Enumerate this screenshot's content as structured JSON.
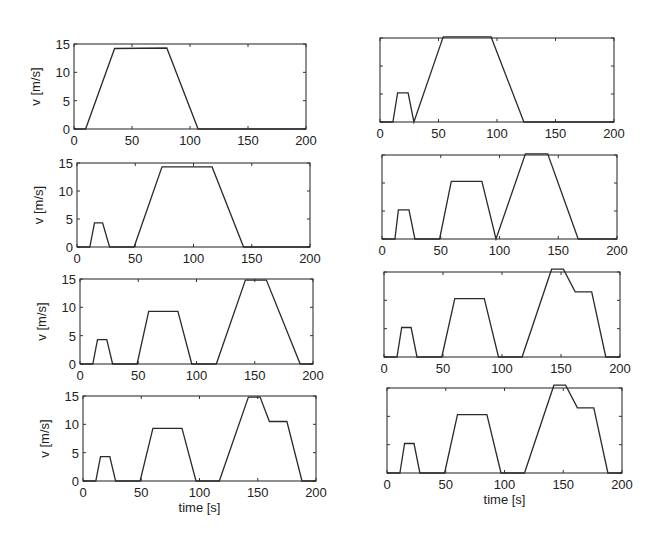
{
  "chart_data": [
    {
      "type": "line",
      "panel": "row1-left",
      "title": "",
      "xlabel": "",
      "ylabel": "v [m/s]",
      "xlim": [
        0,
        200
      ],
      "ylim": [
        0,
        15
      ],
      "xticks": [
        0,
        50,
        100,
        150,
        200
      ],
      "yticks": [
        0,
        5,
        10,
        15
      ],
      "show_xticklabels": true,
      "show_yticklabels": true,
      "x": [
        0,
        10,
        35,
        80,
        107,
        200
      ],
      "y": [
        0,
        0,
        14.2,
        14.3,
        0,
        0
      ],
      "box": {
        "left": 74,
        "right": 306,
        "top": 44,
        "bottom": 129
      }
    },
    {
      "type": "line",
      "panel": "row1-right",
      "title": "",
      "xlabel": "",
      "ylabel": "",
      "xlim": [
        0,
        200
      ],
      "ylim": [
        0,
        15
      ],
      "xticks": [
        0,
        50,
        100,
        150,
        200
      ],
      "yticks": [
        0,
        5,
        10,
        15
      ],
      "show_xticklabels": true,
      "show_yticklabels": false,
      "x": [
        0,
        11,
        15,
        24,
        29,
        54,
        95,
        123,
        200
      ],
      "y": [
        0,
        0,
        5.2,
        5.2,
        0,
        15.2,
        15.2,
        0,
        0
      ],
      "box": {
        "left": 380,
        "right": 614,
        "top": 38,
        "bottom": 122
      }
    },
    {
      "type": "line",
      "panel": "row2-left",
      "title": "",
      "xlabel": "",
      "ylabel": "v [m/s]",
      "xlim": [
        0,
        200
      ],
      "ylim": [
        0,
        15
      ],
      "xticks": [
        0,
        50,
        100,
        150,
        200
      ],
      "yticks": [
        0,
        5,
        10,
        15
      ],
      "show_xticklabels": true,
      "show_yticklabels": true,
      "x": [
        0,
        11,
        15,
        22,
        28,
        49,
        73,
        116,
        143,
        200
      ],
      "y": [
        0,
        0,
        4.3,
        4.3,
        0,
        0,
        14.3,
        14.3,
        0,
        0
      ],
      "box": {
        "left": 77,
        "right": 310,
        "top": 163,
        "bottom": 247
      }
    },
    {
      "type": "line",
      "panel": "row2-right",
      "title": "",
      "xlabel": "",
      "ylabel": "",
      "xlim": [
        0,
        200
      ],
      "ylim": [
        0,
        15
      ],
      "xticks": [
        0,
        50,
        100,
        150,
        200
      ],
      "yticks": [
        0,
        5,
        10,
        15
      ],
      "show_xticklabels": true,
      "show_yticklabels": false,
      "x": [
        0,
        11,
        14,
        23,
        28,
        49,
        59,
        85,
        97,
        122,
        141,
        167,
        200
      ],
      "y": [
        0,
        0,
        5.2,
        5.2,
        0,
        0,
        10.3,
        10.3,
        0,
        15.2,
        15.2,
        0,
        0
      ],
      "box": {
        "left": 382,
        "right": 617,
        "top": 155,
        "bottom": 239
      }
    },
    {
      "type": "line",
      "panel": "row3-left",
      "title": "",
      "xlabel": "",
      "ylabel": "v [m/s]",
      "xlim": [
        0,
        200
      ],
      "ylim": [
        0,
        15
      ],
      "xticks": [
        0,
        50,
        100,
        150,
        200
      ],
      "yticks": [
        0,
        5,
        10,
        15
      ],
      "show_xticklabels": true,
      "show_yticklabels": true,
      "x": [
        0,
        11,
        15,
        23,
        28,
        49,
        59,
        84,
        96,
        117,
        142,
        160,
        189,
        200
      ],
      "y": [
        0,
        0,
        4.3,
        4.3,
        0,
        0,
        9.3,
        9.3,
        0,
        0,
        14.8,
        14.8,
        0,
        0
      ],
      "box": {
        "left": 80,
        "right": 313,
        "top": 279,
        "bottom": 364
      }
    },
    {
      "type": "line",
      "panel": "row3-right",
      "title": "",
      "xlabel": "",
      "ylabel": "",
      "xlim": [
        0,
        200
      ],
      "ylim": [
        0,
        15
      ],
      "xticks": [
        0,
        50,
        100,
        150,
        200
      ],
      "yticks": [
        0,
        5,
        10,
        15
      ],
      "show_xticklabels": true,
      "show_yticklabels": false,
      "x": [
        0,
        11,
        15,
        23,
        28,
        49,
        60,
        85,
        97,
        117,
        142,
        152,
        162,
        176,
        188,
        200
      ],
      "y": [
        0,
        0,
        5.2,
        5.2,
        0,
        0,
        10.3,
        10.3,
        0,
        0,
        15.5,
        15.5,
        11.5,
        11.5,
        0,
        0
      ],
      "box": {
        "left": 384,
        "right": 620,
        "top": 272,
        "bottom": 357
      }
    },
    {
      "type": "line",
      "panel": "row4-left",
      "title": "",
      "xlabel": "time [s]",
      "ylabel": "v [m/s]",
      "xlim": [
        0,
        200
      ],
      "ylim": [
        0,
        15
      ],
      "xticks": [
        0,
        50,
        100,
        150,
        200
      ],
      "yticks": [
        0,
        5,
        10,
        15
      ],
      "show_xticklabels": true,
      "show_yticklabels": true,
      "x": [
        0,
        11,
        15,
        23,
        28,
        49,
        60,
        85,
        97,
        117,
        142,
        152,
        160,
        175,
        188,
        200
      ],
      "y": [
        0,
        0,
        4.3,
        4.3,
        0,
        0,
        9.3,
        9.3,
        0,
        0,
        14.8,
        14.8,
        10.5,
        10.5,
        0,
        0
      ],
      "box": {
        "left": 83,
        "right": 316,
        "top": 396,
        "bottom": 481
      }
    },
    {
      "type": "line",
      "panel": "row4-right",
      "title": "",
      "xlabel": "time [s]",
      "ylabel": "",
      "xlim": [
        0,
        200
      ],
      "ylim": [
        0,
        15
      ],
      "xticks": [
        0,
        50,
        100,
        150,
        200
      ],
      "yticks": [
        0,
        5,
        10,
        15
      ],
      "show_xticklabels": true,
      "show_yticklabels": false,
      "x": [
        0,
        11,
        15,
        23,
        28,
        49,
        60,
        85,
        97,
        117,
        142,
        152,
        162,
        176,
        188,
        200
      ],
      "y": [
        0,
        0,
        5.2,
        5.2,
        0,
        0,
        10.3,
        10.3,
        0,
        0,
        15.5,
        15.5,
        11.5,
        11.5,
        0,
        0
      ],
      "box": {
        "left": 387,
        "right": 622,
        "top": 388,
        "bottom": 473
      }
    }
  ],
  "style": {
    "line_color": "#2a2a2a",
    "axis_color": "#333333",
    "background": "#ffffff"
  }
}
